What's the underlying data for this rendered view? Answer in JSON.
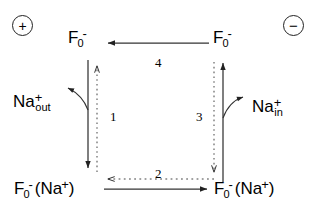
{
  "diagram": {
    "polarity": {
      "positive_side": "+",
      "negative_side": "−"
    },
    "nodes": {
      "top_left": {
        "symbol": "F",
        "subscript": "0",
        "superscript": "-",
        "bound": ""
      },
      "top_right": {
        "symbol": "F",
        "subscript": "0",
        "superscript": "-",
        "bound": ""
      },
      "bottom_left": {
        "symbol": "F",
        "subscript": "0",
        "superscript": "-",
        "bound": "(Na",
        "bound_sup": "+",
        "bound_close": ")"
      },
      "bottom_right": {
        "symbol": "F",
        "subscript": "0",
        "superscript": "-",
        "bound": "(Na",
        "bound_sup": "+",
        "bound_close": ")"
      }
    },
    "ions": {
      "left": {
        "symbol": "Na",
        "superscript": "+",
        "subscript": "out"
      },
      "right": {
        "symbol": "Na",
        "superscript": "+",
        "subscript": "in"
      }
    },
    "steps": {
      "left": "1",
      "bottom": "2",
      "right": "3",
      "top": "4"
    }
  }
}
